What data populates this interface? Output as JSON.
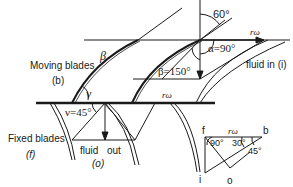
{
  "diagram": {
    "labels": {
      "moving_blades": "Moving blades",
      "moving_blades_sym": "(b)",
      "fixed_blades": "Fixed blades",
      "fixed_blades_sym": "(f)",
      "fluid_in": "fluid in (i)",
      "fluid_out": "fluid",
      "fluid_out2": "out",
      "fluid_out_sym": "(o)",
      "angle_60": "60°",
      "alpha": "α=90°",
      "beta150": "β=150°",
      "beta": "β",
      "nu": "ν",
      "nu45": "ν=45°",
      "rw_top": "rω",
      "rw_mid": "rω",
      "rw_tri": "rω",
      "tri_f": "f",
      "tri_b": "b",
      "tri_i": "i",
      "tri_o": "o",
      "tri_90": "90°",
      "tri_30": "30°",
      "tri_45": "45°"
    },
    "colors": {
      "line": "#1a1a1a",
      "background": "#ffffff"
    }
  }
}
